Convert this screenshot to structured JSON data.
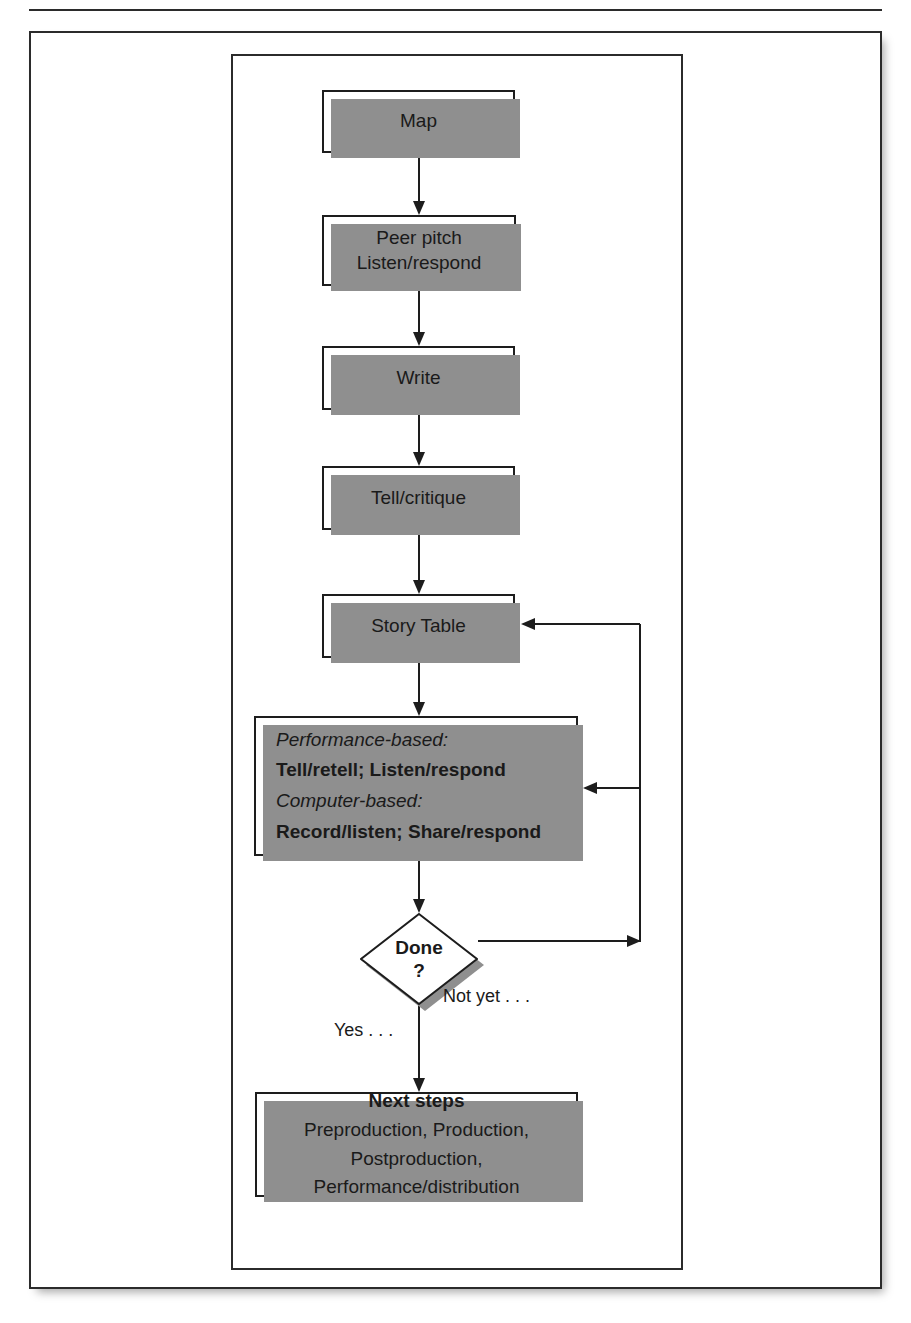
{
  "figure": {
    "kind": "flowchart"
  },
  "nodes": {
    "map": {
      "label": "Map"
    },
    "peer_pitch": {
      "line1": "Peer pitch",
      "line2": "Listen/respond"
    },
    "write": {
      "label": "Write"
    },
    "tell_critique": {
      "label": "Tell/critique"
    },
    "story_table": {
      "label": "Story Table"
    },
    "methods": {
      "performance_heading": "Performance-based:",
      "performance_detail": "Tell/retell; Listen/respond",
      "computer_heading": "Computer-based:",
      "computer_detail": "Record/listen; Share/respond"
    },
    "decision": {
      "line1": "Done",
      "line2": "?"
    },
    "next_steps": {
      "heading": "Next steps",
      "line1": "Preproduction, Production,",
      "line2": "Postproduction,",
      "line3": "Performance/distribution"
    }
  },
  "edge_labels": {
    "yes": "Yes . . .",
    "not_yet": "Not yet . . ."
  },
  "colors": {
    "stroke": "#1d1d1d",
    "shadow": "#8f8f8f",
    "frame": "#2b2b2b",
    "background": "#ffffff"
  },
  "flow_order": [
    "Map",
    "Peer pitch / Listen/respond",
    "Write",
    "Tell/critique",
    "Story Table",
    "Performance-based / Computer-based activities",
    "Done ?",
    "Next steps"
  ]
}
